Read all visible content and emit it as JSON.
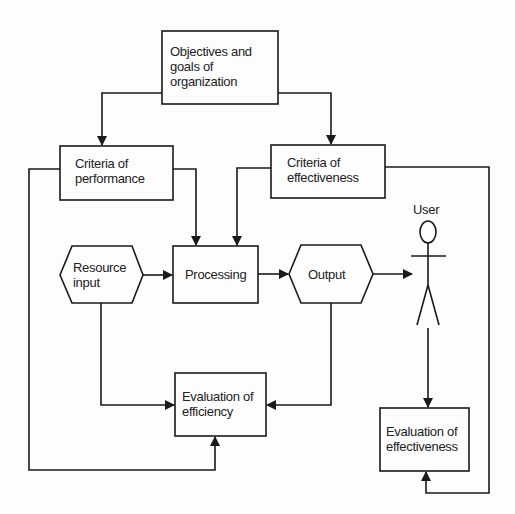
{
  "diagram": {
    "nodes": {
      "objectives": {
        "lines": [
          "Objectives and",
          "goals of",
          "organization"
        ]
      },
      "criteria_performance": {
        "lines": [
          "Criteria of",
          "performance"
        ]
      },
      "criteria_effectiveness": {
        "lines": [
          "Criteria of",
          "effectiveness"
        ]
      },
      "resource_input": {
        "lines": [
          "Resource",
          "input"
        ]
      },
      "processing": {
        "lines": [
          "Processing"
        ]
      },
      "output": {
        "lines": [
          "Output"
        ]
      },
      "user": {
        "label": "User"
      },
      "evaluation_efficiency": {
        "lines": [
          "Evaluation of",
          "efficiency"
        ]
      },
      "evaluation_effectiveness": {
        "lines": [
          "Evaluation of",
          "effectiveness"
        ]
      }
    },
    "edges": [
      {
        "from": "objectives",
        "to": "criteria_performance"
      },
      {
        "from": "objectives",
        "to": "criteria_effectiveness"
      },
      {
        "from": "criteria_performance",
        "to": "processing"
      },
      {
        "from": "criteria_effectiveness",
        "to": "processing"
      },
      {
        "from": "resource_input",
        "to": "processing"
      },
      {
        "from": "processing",
        "to": "output"
      },
      {
        "from": "output",
        "to": "user"
      },
      {
        "from": "resource_input",
        "to": "evaluation_efficiency"
      },
      {
        "from": "output",
        "to": "evaluation_efficiency"
      },
      {
        "from": "criteria_performance",
        "to": "evaluation_efficiency"
      },
      {
        "from": "user",
        "to": "evaluation_effectiveness"
      },
      {
        "from": "criteria_effectiveness",
        "to": "evaluation_effectiveness"
      }
    ],
    "colors": {
      "line": "#1a1a1a",
      "background": "#fdfdfd"
    }
  }
}
